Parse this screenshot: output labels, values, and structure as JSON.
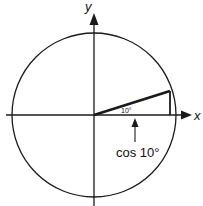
{
  "diagram": {
    "axes": {
      "x_label": "x",
      "y_label": "y"
    },
    "angle_label": "10°",
    "projection_label": "cos 10°",
    "angle_degrees": 10,
    "colors": {
      "stroke": "#1a1a1a",
      "background": "#ffffff"
    }
  }
}
